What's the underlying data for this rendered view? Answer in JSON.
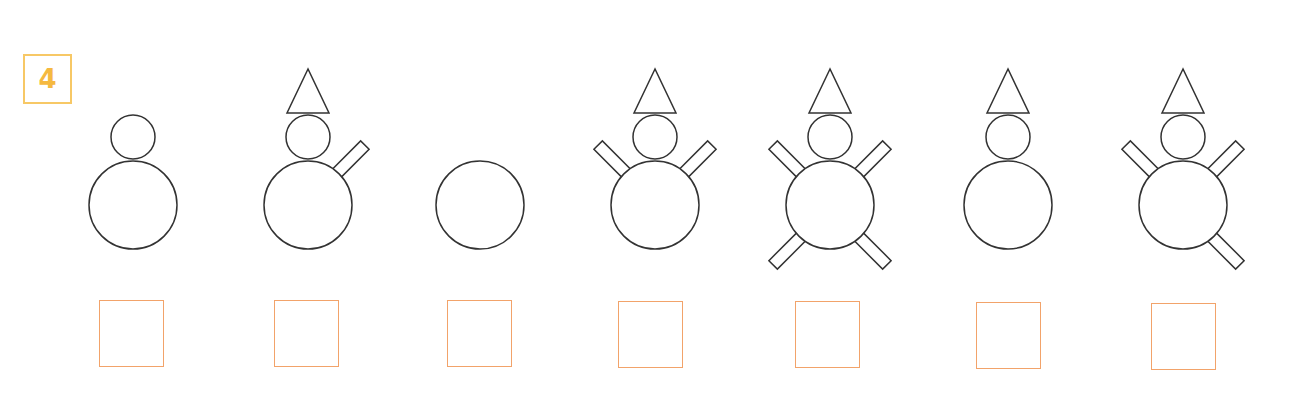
{
  "exercise": {
    "number": "4",
    "badge_color": "#f5b940"
  },
  "figures": [
    {
      "cx": 133,
      "hat": false,
      "arms": []
    },
    {
      "cx": 308,
      "hat": true,
      "arms": [
        "upper-right"
      ]
    },
    {
      "cx": 480,
      "hat": false,
      "head": false,
      "arms": []
    },
    {
      "cx": 655,
      "hat": true,
      "arms": [
        "upper-left",
        "upper-right"
      ]
    },
    {
      "cx": 830,
      "hat": true,
      "arms": [
        "upper-left",
        "upper-right",
        "lower-left",
        "lower-right"
      ]
    },
    {
      "cx": 1008,
      "hat": true,
      "arms": []
    },
    {
      "cx": 1183,
      "hat": true,
      "arms": [
        "upper-left",
        "upper-right",
        "lower-right"
      ]
    }
  ],
  "answer_boxes": [
    {
      "x": 99,
      "y": 300
    },
    {
      "x": 274,
      "y": 300
    },
    {
      "x": 447,
      "y": 300
    },
    {
      "x": 618,
      "y": 301
    },
    {
      "x": 795,
      "y": 301
    },
    {
      "x": 976,
      "y": 302
    },
    {
      "x": 1151,
      "y": 303
    }
  ],
  "colors": {
    "stroke": "#333333",
    "box": "#f2a36a"
  }
}
